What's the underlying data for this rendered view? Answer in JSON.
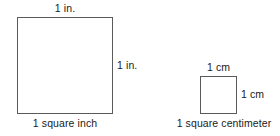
{
  "figure": {
    "background_color": "#ffffff",
    "stroke_color": "#5a5a5a",
    "text_color": "#1a1a1a",
    "shapes": [
      {
        "id": "square-inch",
        "name": "1 square inch",
        "unit": "in.",
        "side_length_value": "1",
        "top_label": "1 in.",
        "side_label": "1 in.",
        "caption": "1 square inch"
      },
      {
        "id": "square-centimeter",
        "name": "1 square centimeter",
        "unit": "cm",
        "side_length_value": "1",
        "top_label": "1 cm",
        "side_label": "1 cm",
        "caption": "1 square centimeter"
      }
    ]
  }
}
